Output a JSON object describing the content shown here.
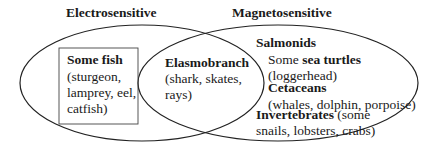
{
  "sets": {
    "left": {
      "title": "Electrosensitive"
    },
    "right": {
      "title": "Magnetosensitive"
    }
  },
  "left_only": {
    "box_title": "Some fish",
    "box_lines": [
      "(sturgeon,",
      "lamprey, eel,",
      "catfish)"
    ]
  },
  "intersection": {
    "title": "Elasmobranch",
    "lines": [
      "(shark, skates,",
      "rays)"
    ]
  },
  "right_only": {
    "salmonids": "Salmonids",
    "turtles_prefix": "Some ",
    "turtles_bold": "sea turtles",
    "turtles_detail": "(loggerhead)",
    "cetaceans": "Cetaceans",
    "cetaceans_detail": "(whales, dolphin, porpoise)",
    "invertebrates": "Invertebrates",
    "invertebrates_detail_1": " (some",
    "invertebrates_detail_2": "snails, lobsters, crabs)"
  },
  "colors": {
    "stroke": "#222222",
    "text": "#1a1a1a",
    "background": "#ffffff"
  }
}
